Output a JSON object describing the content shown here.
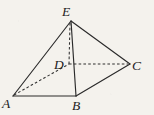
{
  "figure": {
    "kind": "geometry-diagram",
    "background_color": "#f4f2ed",
    "line_color": "#2a2a2a",
    "width": 154,
    "height": 115,
    "vertices": [
      {
        "id": "E",
        "label": "E",
        "x": 71,
        "y": 21,
        "label_x": 62,
        "label_y": 16
      },
      {
        "id": "D",
        "label": "D",
        "x": 69,
        "y": 64,
        "label_x": 54,
        "label_y": 69
      },
      {
        "id": "C",
        "label": "C",
        "x": 130,
        "y": 64,
        "label_x": 132,
        "label_y": 70
      },
      {
        "id": "A",
        "label": "A",
        "x": 13,
        "y": 96,
        "label_x": 2,
        "label_y": 108
      },
      {
        "id": "B",
        "label": "B",
        "x": 76,
        "y": 96,
        "label_x": 72,
        "label_y": 110
      }
    ],
    "edges_solid": [
      {
        "name": "edge-EA",
        "from": "E",
        "to": "A",
        "x1": 71,
        "y1": 21,
        "x2": 13,
        "y2": 96
      },
      {
        "name": "edge-EB",
        "from": "E",
        "to": "B",
        "x1": 71,
        "y1": 21,
        "x2": 76,
        "y2": 96
      },
      {
        "name": "edge-EC",
        "from": "E",
        "to": "C",
        "x1": 71,
        "y1": 21,
        "x2": 130,
        "y2": 64
      },
      {
        "name": "edge-AB",
        "from": "A",
        "to": "B",
        "x1": 13,
        "y1": 96,
        "x2": 76,
        "y2": 96
      },
      {
        "name": "edge-BC",
        "from": "B",
        "to": "C",
        "x1": 76,
        "y1": 96,
        "x2": 130,
        "y2": 64
      }
    ],
    "edges_dashed": [
      {
        "name": "edge-ED",
        "from": "E",
        "to": "D",
        "x1": 70,
        "y1": 23,
        "x2": 69,
        "y2": 64
      },
      {
        "name": "edge-DC",
        "from": "D",
        "to": "C",
        "x1": 69,
        "y1": 64,
        "x2": 128,
        "y2": 64
      },
      {
        "name": "edge-AD",
        "from": "A",
        "to": "D",
        "x1": 14,
        "y1": 95,
        "x2": 69,
        "y2": 64
      }
    ]
  }
}
